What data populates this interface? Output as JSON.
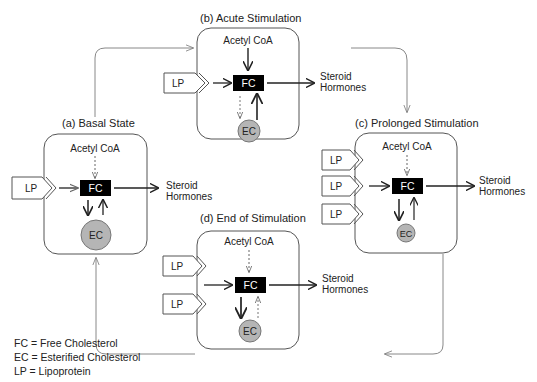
{
  "states": {
    "a": {
      "label": "(a)  Basal State",
      "acetyl": "Acetyl CoA",
      "fc": "FC",
      "ec": "EC",
      "lp": [
        "LP"
      ],
      "steroid": [
        "Steroid",
        "Hormones"
      ]
    },
    "b": {
      "label": "(b)  Acute Stimulation",
      "acetyl": "Acetyl CoA",
      "fc": "FC",
      "ec": "EC",
      "lp": [
        "LP"
      ],
      "steroid": [
        "Steroid",
        "Hormones"
      ]
    },
    "c": {
      "label": "(c)  Prolonged Stimulation",
      "acetyl": "Acetyl CoA",
      "fc": "FC",
      "ec": "EC",
      "lp": [
        "LP",
        "LP",
        "LP"
      ],
      "steroid": [
        "Steroid",
        "Hormones"
      ]
    },
    "d": {
      "label": "(d)  End of Stimulation",
      "acetyl": "Acetyl CoA",
      "fc": "FC",
      "ec": "EC",
      "lp": [
        "LP",
        "LP"
      ],
      "steroid": [
        "Steroid",
        "Hormones"
      ]
    }
  },
  "legend": [
    "FC = Free Cholesterol",
    "EC = Esterified Cholesterol",
    "LP = Lipoprotein"
  ],
  "colors": {
    "fc_box": "#000000",
    "ec_circle": "#b5b5b5",
    "line": "#333333",
    "box_border": "#555555"
  }
}
